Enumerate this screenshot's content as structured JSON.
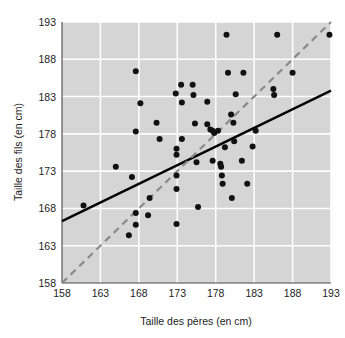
{
  "chart_data": {
    "type": "scatter",
    "title": "",
    "xlabel": "Taille des pères (en cm)",
    "ylabel": "Taille des fils (en cm)",
    "xlim": [
      158,
      193
    ],
    "ylim": [
      158,
      193
    ],
    "xticks": [
      158,
      163,
      168,
      173,
      178,
      183,
      188,
      193
    ],
    "yticks": [
      158,
      163,
      168,
      173,
      178,
      183,
      188,
      193
    ],
    "grid": true,
    "legend": "none",
    "background_color": "#d5d5d5",
    "gridline_color": "#fdfdfd",
    "point_color": "#111111",
    "points": [
      [
        160.8,
        168.4
      ],
      [
        165.0,
        173.6
      ],
      [
        166.7,
        164.4
      ],
      [
        167.1,
        172.2
      ],
      [
        167.6,
        186.4
      ],
      [
        167.6,
        178.3
      ],
      [
        167.6,
        167.4
      ],
      [
        167.6,
        165.8
      ],
      [
        168.2,
        182.1
      ],
      [
        169.2,
        167.1
      ],
      [
        169.4,
        169.4
      ],
      [
        170.3,
        179.5
      ],
      [
        170.7,
        177.3
      ],
      [
        172.8,
        183.4
      ],
      [
        172.9,
        176.0
      ],
      [
        172.9,
        175.2
      ],
      [
        172.9,
        172.4
      ],
      [
        172.9,
        170.6
      ],
      [
        172.9,
        165.9
      ],
      [
        173.5,
        184.6
      ],
      [
        173.6,
        182.2
      ],
      [
        173.6,
        177.3
      ],
      [
        175.0,
        184.6
      ],
      [
        175.1,
        183.2
      ],
      [
        175.3,
        179.4
      ],
      [
        175.5,
        174.2
      ],
      [
        175.7,
        168.2
      ],
      [
        176.9,
        182.3
      ],
      [
        176.9,
        179.3
      ],
      [
        177.3,
        178.6
      ],
      [
        177.6,
        178.4
      ],
      [
        177.6,
        174.4
      ],
      [
        177.8,
        178.1
      ],
      [
        178.3,
        178.4
      ],
      [
        178.6,
        174.0
      ],
      [
        178.7,
        173.6
      ],
      [
        178.8,
        172.4
      ],
      [
        178.9,
        171.3
      ],
      [
        179.2,
        176.2
      ],
      [
        179.4,
        191.3
      ],
      [
        179.6,
        186.2
      ],
      [
        180.0,
        180.6
      ],
      [
        180.1,
        169.4
      ],
      [
        180.3,
        179.5
      ],
      [
        180.4,
        177.0
      ],
      [
        180.6,
        183.3
      ],
      [
        181.4,
        174.4
      ],
      [
        181.6,
        186.2
      ],
      [
        182.1,
        171.3
      ],
      [
        182.8,
        176.3
      ],
      [
        183.2,
        178.4
      ],
      [
        185.5,
        184.0
      ],
      [
        185.6,
        183.2
      ],
      [
        186.0,
        191.3
      ],
      [
        188.0,
        186.2
      ],
      [
        192.8,
        191.3
      ]
    ],
    "reference_lines": [
      {
        "name": "regression-line",
        "style": "solid",
        "color": "#000000",
        "x": [
          158,
          193
        ],
        "y": [
          166.3,
          183.8
        ]
      },
      {
        "name": "identity-line",
        "style": "dashed",
        "color": "#8a8a8a",
        "x": [
          158,
          193
        ],
        "y": [
          158,
          193
        ]
      }
    ]
  }
}
